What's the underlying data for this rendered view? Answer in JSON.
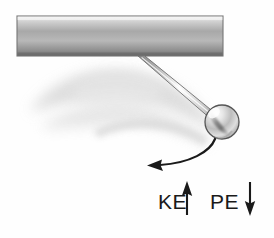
{
  "figure": {
    "background_color": "#fefefe"
  },
  "support_bar": {
    "name": "ceiling-support-bar",
    "x": 17,
    "y": 16,
    "width": 206,
    "height": 40,
    "gradient_top": "#f2f2f2",
    "gradient_mid": "#9b9b9b",
    "gradient_bottom": "#6f6f6f",
    "outline_color": "#6a6a6a"
  },
  "rod": {
    "name": "pendulum-rod",
    "pivot_x": 141,
    "pivot_y": 56,
    "bob_x": 219,
    "bob_y": 118,
    "thickness": 7,
    "light_color": "#fcfcfc",
    "dark_color": "#8a8a8a",
    "outline_color": "#707070"
  },
  "bob": {
    "name": "pendulum-bob",
    "cx": 222,
    "cy": 122,
    "r": 17,
    "highlight_color": "#ffffff",
    "mid_color": "#d8d8d8",
    "shade_color": "#8c8c8c",
    "outline_color": "#4f4f4f"
  },
  "motion_arc": {
    "name": "swing-direction-arrow",
    "start_x": 214,
    "start_y": 139,
    "end_x": 150,
    "end_y": 165,
    "stroke_color": "#1a1a1a",
    "stroke_width": 2.2,
    "arrowhead_direction": "left"
  },
  "blur_shadow": {
    "name": "motion-blur-shadow",
    "color": "#d9d9d9",
    "opacity": 0.75
  },
  "labels": [
    {
      "id": "ke",
      "text": "KE",
      "x": 158,
      "y": 209,
      "arrow": {
        "name": "ke-up-arrow",
        "direction": "up",
        "x": 187,
        "top_y": 182,
        "bottom_y": 215,
        "color": "#1a1a1a"
      }
    },
    {
      "id": "pe",
      "text": "PE",
      "x": 210,
      "y": 209,
      "arrow": {
        "name": "pe-down-arrow",
        "direction": "down",
        "x": 250,
        "top_y": 182,
        "bottom_y": 215,
        "color": "#1a1a1a"
      }
    }
  ]
}
